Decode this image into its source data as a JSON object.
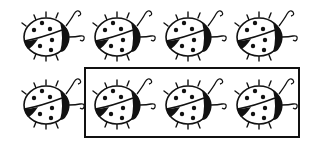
{
  "figure": {
    "ink_color": "#111111",
    "background": "#ffffff",
    "rows": [
      {
        "count": 4,
        "boxed": [
          false,
          false,
          false,
          false
        ]
      },
      {
        "count": 4,
        "boxed": [
          false,
          true,
          true,
          true
        ]
      }
    ],
    "total_ladybugs": 8,
    "boxed_ladybugs": 3
  }
}
